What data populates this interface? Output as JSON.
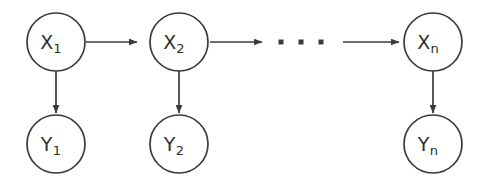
{
  "diagram": {
    "type": "directed-graph",
    "background_color": "#ffffff",
    "stroke_color": "#3a3a3a",
    "text_color": "#2e2e2e",
    "node_radius": 29,
    "hidden_nodes": [
      {
        "id": "x1",
        "base": "X",
        "subscript": "1",
        "label": "X1",
        "cx": 56,
        "cy": 42
      },
      {
        "id": "x2",
        "base": "X",
        "subscript": "2",
        "label": "X2",
        "cx": 179,
        "cy": 42
      },
      {
        "id": "xn",
        "base": "X",
        "subscript": "n",
        "label": "Xn",
        "cx": 433,
        "cy": 42
      }
    ],
    "observed_nodes": [
      {
        "id": "y1",
        "base": "Y",
        "subscript": "1",
        "label": "Y1",
        "cx": 56,
        "cy": 144
      },
      {
        "id": "y2",
        "base": "Y",
        "subscript": "2",
        "label": "Y2",
        "cx": 179,
        "cy": 144
      },
      {
        "id": "yn",
        "base": "Y",
        "subscript": "n",
        "label": "Yn",
        "cx": 433,
        "cy": 144
      }
    ],
    "transition_arrows": [
      {
        "id": "x1-to-x2",
        "from": "x1",
        "to": "x2",
        "x1": 86,
        "x2": 148,
        "y": 42
      },
      {
        "id": "x2-to-dots",
        "from": "x2",
        "to": "ellipsis",
        "x1": 210,
        "x2": 263,
        "y": 42
      },
      {
        "id": "dots-to-xn",
        "from": "ellipsis",
        "to": "xn",
        "x1": 343,
        "x2": 402,
        "y": 42
      }
    ],
    "emission_arrows": [
      {
        "id": "x1-to-y1",
        "from": "x1",
        "to": "y1",
        "x": 56,
        "y1": 71,
        "y2": 113
      },
      {
        "id": "x2-to-y2",
        "from": "x2",
        "to": "y2",
        "x": 179,
        "y1": 71,
        "y2": 113
      },
      {
        "id": "xn-to-yn",
        "from": "xn",
        "to": "yn",
        "x": 433,
        "y1": 71,
        "y2": 113
      }
    ],
    "ellipsis": {
      "id": "chain-ellipsis",
      "label": "...",
      "dot_size": 5,
      "cy": 42,
      "dots_x": [
        281,
        301,
        321
      ]
    }
  }
}
